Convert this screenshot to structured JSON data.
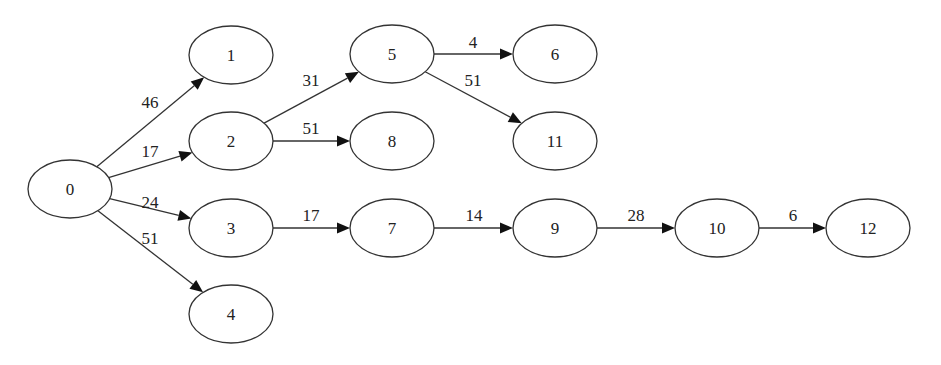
{
  "diagram": {
    "type": "directed-weighted-graph",
    "nodes": [
      {
        "id": "0",
        "label": "0",
        "x": 70,
        "y": 189
      },
      {
        "id": "1",
        "label": "1",
        "x": 231,
        "y": 55
      },
      {
        "id": "2",
        "label": "2",
        "x": 231,
        "y": 141
      },
      {
        "id": "3",
        "label": "3",
        "x": 231,
        "y": 228
      },
      {
        "id": "4",
        "label": "4",
        "x": 231,
        "y": 314
      },
      {
        "id": "5",
        "label": "5",
        "x": 392,
        "y": 54
      },
      {
        "id": "6",
        "label": "6",
        "x": 555,
        "y": 54
      },
      {
        "id": "8",
        "label": "8",
        "x": 392,
        "y": 141
      },
      {
        "id": "11",
        "label": "11",
        "x": 555,
        "y": 141
      },
      {
        "id": "7",
        "label": "7",
        "x": 392,
        "y": 228
      },
      {
        "id": "9",
        "label": "9",
        "x": 555,
        "y": 228
      },
      {
        "id": "10",
        "label": "10",
        "x": 717,
        "y": 228
      },
      {
        "id": "12",
        "label": "12",
        "x": 868,
        "y": 228
      }
    ],
    "edges": [
      {
        "from": "0",
        "to": "1",
        "weight": "46",
        "lx": 150,
        "ly": 108
      },
      {
        "from": "0",
        "to": "2",
        "weight": "17",
        "lx": 150,
        "ly": 157
      },
      {
        "from": "0",
        "to": "3",
        "weight": "24",
        "lx": 150,
        "ly": 208
      },
      {
        "from": "0",
        "to": "4",
        "weight": "51",
        "lx": 150,
        "ly": 244
      },
      {
        "from": "2",
        "to": "5",
        "weight": "31",
        "lx": 311,
        "ly": 86
      },
      {
        "from": "2",
        "to": "8",
        "weight": "51",
        "lx": 311,
        "ly": 134
      },
      {
        "from": "5",
        "to": "6",
        "weight": "4",
        "lx": 473,
        "ly": 48
      },
      {
        "from": "5",
        "to": "11",
        "weight": "51",
        "lx": 473,
        "ly": 86
      },
      {
        "from": "3",
        "to": "7",
        "weight": "17",
        "lx": 311,
        "ly": 221
      },
      {
        "from": "7",
        "to": "9",
        "weight": "14",
        "lx": 474,
        "ly": 221
      },
      {
        "from": "9",
        "to": "10",
        "weight": "28",
        "lx": 636,
        "ly": 221
      },
      {
        "from": "10",
        "to": "12",
        "weight": "6",
        "lx": 793,
        "ly": 221
      }
    ]
  }
}
